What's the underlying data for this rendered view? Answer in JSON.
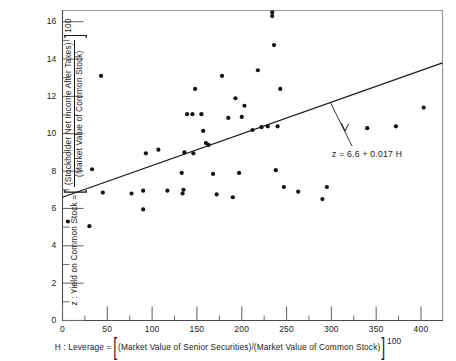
{
  "chart_data": {
    "type": "scatter",
    "title": "",
    "xlabel": "H : Leverage = [(Market Value of Senior Securities)/(Market Value of Common Stock)] 100",
    "ylabel": "z : Yield on Common Stock = [(Stockholder Net Income After Taxes)/(Market Value of Common Stock)] 100",
    "xlim": [
      0,
      424
    ],
    "ylim": [
      0,
      16.6
    ],
    "xticks": [
      0,
      50,
      100,
      150,
      200,
      250,
      300,
      350,
      400
    ],
    "xticks_minor": [
      25,
      75,
      125,
      175,
      225,
      275,
      325,
      375
    ],
    "yticks": [
      0,
      2,
      4,
      6,
      8,
      10,
      12,
      14,
      16
    ],
    "yticks_minor": [
      1,
      3,
      5,
      7,
      9,
      11,
      13,
      15
    ],
    "grid": false,
    "legend": "none",
    "points": [
      [
        6,
        5.3
      ],
      [
        30,
        5.05
      ],
      [
        33,
        8.1
      ],
      [
        43,
        13.1
      ],
      [
        45,
        6.85
      ],
      [
        77,
        6.8
      ],
      [
        90,
        5.95
      ],
      [
        90,
        6.95
      ],
      [
        93,
        8.95
      ],
      [
        107,
        9.15
      ],
      [
        117,
        6.95
      ],
      [
        133,
        7.9
      ],
      [
        134,
        6.8
      ],
      [
        135,
        7.0
      ],
      [
        136,
        9.0
      ],
      [
        139,
        11.05
      ],
      [
        145,
        11.05
      ],
      [
        146,
        8.95
      ],
      [
        148,
        12.4
      ],
      [
        155,
        11.05
      ],
      [
        157,
        10.15
      ],
      [
        160,
        9.5
      ],
      [
        163,
        9.4
      ],
      [
        168,
        7.85
      ],
      [
        172,
        6.75
      ],
      [
        178,
        13.1
      ],
      [
        185,
        10.85
      ],
      [
        190,
        6.6
      ],
      [
        193,
        11.9
      ],
      [
        197,
        7.9
      ],
      [
        200,
        10.9
      ],
      [
        203,
        11.5
      ],
      [
        212,
        10.2
      ],
      [
        218,
        13.4
      ],
      [
        222,
        10.35
      ],
      [
        229,
        10.4
      ],
      [
        234,
        16.5
      ],
      [
        234,
        16.3
      ],
      [
        236,
        14.75
      ],
      [
        238,
        8.05
      ],
      [
        240,
        10.4
      ],
      [
        243,
        12.4
      ],
      [
        247,
        7.15
      ],
      [
        263,
        6.9
      ],
      [
        290,
        6.5
      ],
      [
        295,
        7.15
      ],
      [
        340,
        10.3
      ],
      [
        372,
        10.4
      ],
      [
        403,
        11.4
      ]
    ],
    "fit_line": {
      "equation_label": "z = 6.6 + 0.017 H",
      "intercept": 6.6,
      "slope": 0.017,
      "x_start": 0,
      "x_end": 424,
      "y_start": 6.6,
      "y_end": 13.8
    }
  },
  "axes": {
    "x_tick_labels": [
      "0",
      "50",
      "100",
      "150",
      "200",
      "250",
      "300",
      "350",
      "400"
    ],
    "y_tick_labels": [
      "0",
      "2",
      "4",
      "6",
      "8",
      "10",
      "12",
      "14",
      "16"
    ]
  },
  "y_axis_title": {
    "prefix": "z : Yield on Common Stock =",
    "numerator": "(Stockholder Net Income After Taxes)",
    "denominator": "(Market Value of Common Stock)",
    "suffix": "100"
  },
  "x_axis_title": {
    "prefix": "H : Leverage =",
    "body": "(Market Value of Senior Securities)/(Market Value of Common Stock)",
    "suffix": "100"
  },
  "colors": {
    "ink": "#1a1a1a",
    "frame": "#9a9a9a",
    "point": "#111111",
    "background": "#ffffff"
  }
}
